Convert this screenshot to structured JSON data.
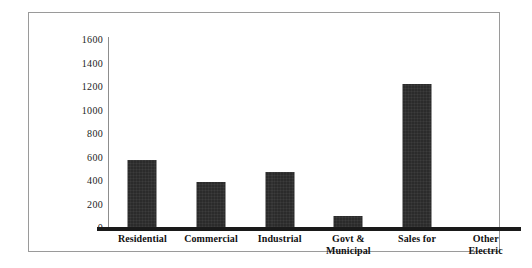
{
  "chart_data": {
    "type": "bar",
    "title": "",
    "subtitle": "",
    "xlabel": "",
    "ylabel": "",
    "ylim": [
      0,
      1600
    ],
    "grid": false,
    "legend": "none",
    "categories": [
      "Residential",
      "Commercial",
      "Industrial",
      "Govt & Municipal",
      "Sales for",
      "Other Electric"
    ],
    "category_lines": [
      [
        "Residential"
      ],
      [
        "Commercial"
      ],
      [
        "Industrial"
      ],
      [
        "Govt &",
        "Municipal"
      ],
      [
        "Sales for"
      ],
      [
        "Other",
        "Electric"
      ]
    ],
    "values": [
      570,
      385,
      470,
      95,
      1220,
      0
    ],
    "yticks": [
      1600,
      1400,
      1200,
      1000,
      800,
      600,
      400,
      200,
      0
    ],
    "ytick_labels": [
      "1600",
      "1400",
      "1200",
      "1000",
      "800",
      "600",
      "400",
      "200",
      "0"
    ],
    "bar_color": "#2b2b2b",
    "axis_color": "#1a1a1a",
    "frame_color": "#9a9a9a"
  }
}
